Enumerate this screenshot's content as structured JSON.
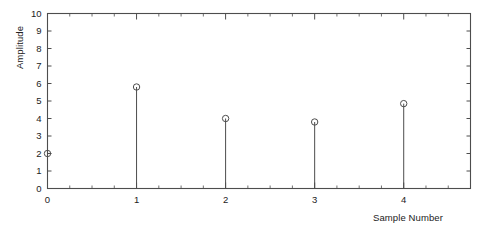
{
  "chart_data": {
    "type": "stem",
    "title": "",
    "xlabel": "Sample Number",
    "ylabel": "Amplitude",
    "x": [
      0,
      1,
      2,
      3,
      4
    ],
    "values": [
      2,
      5.8,
      4,
      3.8,
      4.85
    ],
    "xlim": [
      0,
      4.75
    ],
    "ylim": [
      0,
      10
    ],
    "xticks": [
      0,
      1,
      2,
      3,
      4
    ],
    "xtick_labels": [
      "0",
      "1",
      "2",
      "3",
      "4"
    ],
    "yticks": [
      0,
      1,
      2,
      3,
      4,
      5,
      6,
      7,
      8,
      9,
      10
    ],
    "ytick_labels": [
      "0",
      "1",
      "2",
      "3",
      "4",
      "5",
      "6",
      "7",
      "8",
      "9",
      "10"
    ],
    "x_minor_tick_interval": 0.25,
    "grid": false,
    "legend": null,
    "marker": "circle-open",
    "line_color": "#4d4d4d",
    "marker_color": "#4d4d4d",
    "axis_color": "#4d4d4d",
    "background": "#ffffff"
  },
  "axis_labels": {
    "y_title": "Amplitude",
    "x_title": "Sample Number"
  }
}
